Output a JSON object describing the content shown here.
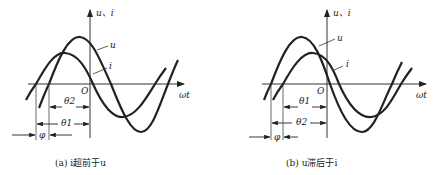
{
  "panels": [
    {
      "id": "a",
      "caption": "(a) i超前于u",
      "axis_y_label": "u、i",
      "axis_x_label": "ωt",
      "origin_label": "O",
      "curve_labels": {
        "u": "u",
        "i": "i"
      },
      "dims": {
        "upper": "θ2",
        "lower": "θ1",
        "phase": "φ"
      }
    },
    {
      "id": "b",
      "caption": "(b) u滞后于i",
      "axis_y_label": "u、i",
      "axis_x_label": "ωt",
      "origin_label": "O",
      "curve_labels": {
        "u": "u",
        "i": "i"
      },
      "dims": {
        "upper": "θ1",
        "lower": "θ2",
        "phase": "φ"
      }
    }
  ],
  "colors": {
    "stroke": "#222222",
    "thin": "#444444"
  }
}
